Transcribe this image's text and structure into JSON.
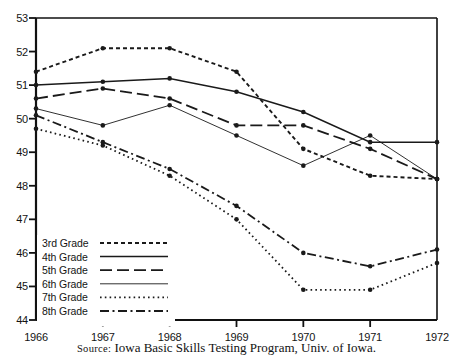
{
  "chart_data": {
    "type": "line",
    "title": "",
    "subtitle": "",
    "xlabel": "",
    "ylabel": "",
    "x": [
      1966,
      1967,
      1968,
      1969,
      1970,
      1971,
      1972
    ],
    "xtick_labels": [
      "1966",
      "1967",
      "1968",
      "1969",
      "1970",
      "1971",
      "1972"
    ],
    "ytick_labels": [
      "53",
      "52",
      "51",
      "50",
      "49",
      "48",
      "47",
      "46",
      "45",
      "44"
    ],
    "ytick_values": [
      53,
      52,
      51,
      50,
      49,
      48,
      47,
      46,
      45,
      44
    ],
    "ylim": [
      44,
      53
    ],
    "xlim": [
      1966,
      1972
    ],
    "grid": false,
    "legend_position": "lower-left-inside",
    "series": [
      {
        "name": "3rd Grade",
        "style": "dashed",
        "values": [
          51.4,
          52.1,
          52.1,
          51.4,
          49.1,
          48.3,
          48.2
        ]
      },
      {
        "name": "4th Grade",
        "style": "solid",
        "values": [
          51.0,
          51.1,
          51.2,
          50.8,
          50.2,
          49.3,
          49.3
        ]
      },
      {
        "name": "5th Grade",
        "style": "long-dash",
        "values": [
          50.6,
          50.9,
          50.6,
          49.8,
          49.8,
          49.1,
          48.2
        ]
      },
      {
        "name": "6th Grade",
        "style": "thin-solid",
        "values": [
          50.3,
          49.8,
          50.4,
          49.5,
          48.6,
          49.5,
          48.2
        ]
      },
      {
        "name": "7th Grade",
        "style": "dotted",
        "values": [
          49.7,
          49.2,
          48.3,
          47.0,
          44.9,
          44.9,
          45.7
        ]
      },
      {
        "name": "8th Grade",
        "style": "dash-dot",
        "values": [
          50.1,
          49.3,
          48.5,
          47.4,
          46.0,
          45.6,
          46.1
        ]
      }
    ]
  },
  "legend": {
    "entries": [
      {
        "label": "3rd Grade"
      },
      {
        "label": "4th Grade"
      },
      {
        "label": "5th Grade"
      },
      {
        "label": "6th Grade"
      },
      {
        "label": "7th Grade"
      },
      {
        "label": "8th Grade"
      }
    ]
  },
  "source": {
    "label": "Source:",
    "text": "Iowa Basic Skills Testing Program, Univ. of Iowa."
  },
  "colors": {
    "line": "#1a1a1a",
    "axis": "#111111",
    "background": "#ffffff",
    "text": "#141414"
  }
}
